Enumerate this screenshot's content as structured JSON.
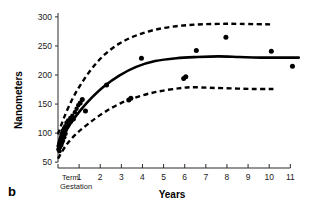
{
  "panel": {
    "label": "b"
  },
  "chart_data": {
    "type": "scatter",
    "title": "",
    "xlabel": "Years",
    "ylabel": "Nanometers",
    "xlim": [
      0,
      11.6
    ],
    "ylim": [
      40,
      305
    ],
    "grid": false,
    "legend": "none",
    "x_tick_labels": [
      "1",
      "2",
      "3",
      "4",
      "5",
      "6",
      "7",
      "8",
      "9",
      "10",
      "11"
    ],
    "x_tick_values": [
      1,
      2,
      3,
      4,
      5,
      6,
      7,
      8,
      9,
      10,
      11
    ],
    "x_origin_label_line1": "Term",
    "x_origin_label_line2": "Gestation",
    "y_tick_labels": [
      "50",
      "100",
      "150",
      "200",
      "250",
      "300"
    ],
    "y_tick_values": [
      50,
      100,
      150,
      200,
      250,
      300
    ],
    "series": [
      {
        "name": "observations",
        "type": "scatter",
        "marker": "filled-circle",
        "x": [
          0.02,
          0.03,
          0.05,
          0.06,
          0.07,
          0.08,
          0.09,
          0.1,
          0.11,
          0.12,
          0.13,
          0.14,
          0.15,
          0.16,
          0.17,
          0.18,
          0.19,
          0.2,
          0.21,
          0.22,
          0.24,
          0.26,
          0.28,
          0.3,
          0.32,
          0.34,
          0.36,
          0.38,
          0.4,
          0.44,
          0.48,
          0.52,
          0.58,
          0.62,
          0.68,
          0.74,
          0.8,
          0.88,
          0.96,
          1.05,
          1.15,
          1.3,
          2.3,
          3.35,
          3.45,
          3.95,
          5.95,
          6.05,
          6.55,
          7.95,
          10.1,
          11.1
        ],
        "y": [
          72,
          78,
          74,
          82,
          69,
          85,
          80,
          76,
          88,
          90,
          84,
          92,
          79,
          95,
          86,
          98,
          83,
          100,
          91,
          104,
          87,
          96,
          108,
          93,
          102,
          112,
          99,
          106,
          118,
          110,
          122,
          115,
          126,
          120,
          130,
          124,
          136,
          142,
          148,
          152,
          158,
          138,
          183,
          157,
          160,
          229,
          194,
          197,
          242,
          265,
          241,
          215
        ]
      },
      {
        "name": "mean-fit",
        "type": "line",
        "style": "solid",
        "x": [
          0.0,
          0.3,
          0.7,
          1.1,
          1.6,
          2.2,
          2.9,
          3.7,
          4.6,
          5.6,
          6.6,
          7.6,
          8.6,
          9.6,
          11.4
        ],
        "y": [
          78,
          100,
          122,
          141,
          161,
          181,
          199,
          214,
          224,
          229,
          231,
          232,
          231,
          230,
          230
        ]
      },
      {
        "name": "upper-bound",
        "type": "line",
        "style": "dashed",
        "x": [
          0.0,
          0.3,
          0.7,
          1.1,
          1.6,
          2.2,
          2.9,
          3.7,
          4.6,
          5.6,
          6.6,
          7.6,
          8.6,
          10.2
        ],
        "y": [
          98,
          128,
          160,
          185,
          211,
          235,
          254,
          268,
          278,
          284,
          287,
          288,
          288,
          287
        ]
      },
      {
        "name": "lower-bound",
        "type": "line",
        "style": "dashed",
        "x": [
          0.0,
          0.4,
          0.9,
          1.5,
          2.2,
          3.0,
          3.9,
          4.8,
          5.7,
          6.3,
          7.2,
          8.2,
          9.2,
          10.2
        ],
        "y": [
          56,
          80,
          100,
          118,
          136,
          152,
          164,
          172,
          177,
          179,
          178,
          177,
          176,
          176
        ]
      }
    ]
  }
}
